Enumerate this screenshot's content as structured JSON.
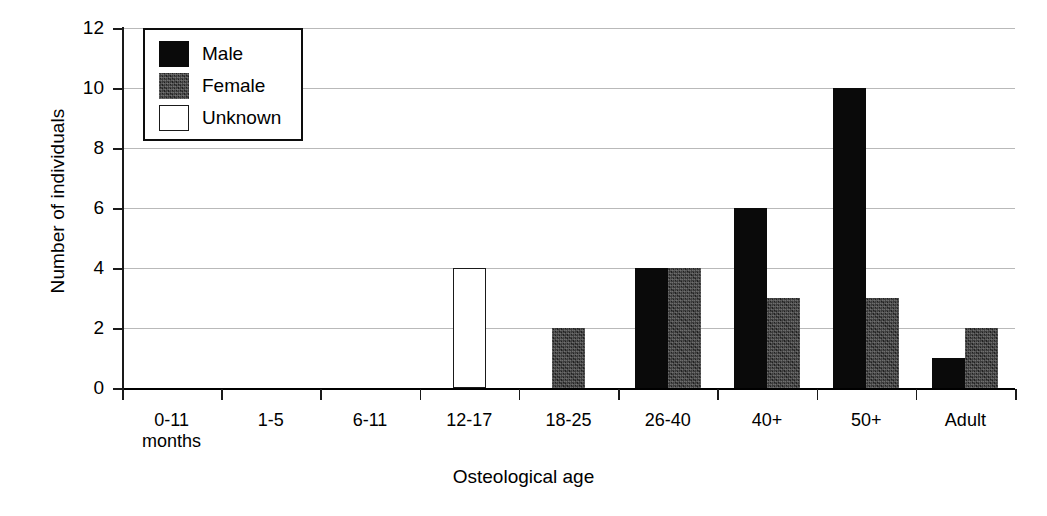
{
  "chart_data": {
    "type": "bar",
    "title": "",
    "xlabel": "Osteological age",
    "ylabel": "Number of individuals",
    "ylim": [
      0,
      12
    ],
    "ytick_step": 2,
    "yticks": [
      0,
      2,
      4,
      6,
      8,
      10,
      12
    ],
    "ytick_labels": [
      "0",
      "2",
      "4",
      "6",
      "8",
      "10",
      "12"
    ],
    "grid": true,
    "grid_axis": "y",
    "legend_position": "top-left",
    "categories": [
      "0-11 months",
      "1-5",
      "6-11",
      "12-17",
      "18-25",
      "26-40",
      "40+",
      "50+",
      "Adult"
    ],
    "category_lines": [
      [
        "0-11",
        "months"
      ],
      [
        "1-5"
      ],
      [
        "6-11"
      ],
      [
        "12-17"
      ],
      [
        "18-25"
      ],
      [
        "26-40"
      ],
      [
        "40+"
      ],
      [
        "50+"
      ],
      [
        "Adult"
      ]
    ],
    "series": [
      {
        "name": "Male",
        "color": "#0a0a0a",
        "fill": "solid-black",
        "values": [
          0,
          0,
          0,
          0,
          0,
          4,
          6,
          10,
          1
        ]
      },
      {
        "name": "Female",
        "color": "#3b3b3b",
        "fill": "dark-textured",
        "values": [
          0,
          0,
          0,
          0,
          2,
          4,
          3,
          3,
          2
        ]
      },
      {
        "name": "Unknown",
        "color": "#ffffff",
        "fill": "white-outlined",
        "values": [
          0,
          0,
          0,
          4,
          0,
          0,
          0,
          0,
          0
        ]
      }
    ]
  },
  "legend": {
    "entries": [
      {
        "label": "Male",
        "swatch": "male"
      },
      {
        "label": "Female",
        "swatch": "female"
      },
      {
        "label": "Unknown",
        "swatch": "unknown"
      }
    ]
  },
  "colors": {
    "male": "#0a0a0a",
    "female": "#3b3b3b",
    "unknown": "#ffffff",
    "gridline": "#b9b9b9",
    "axis": "#1a1a1a",
    "background": "#ffffff"
  }
}
